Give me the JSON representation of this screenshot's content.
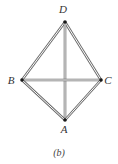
{
  "figure": {
    "caption": "(b)",
    "nodes": [
      {
        "id": "D",
        "label": "D",
        "x": 65,
        "y": 22,
        "lx": 63,
        "ly": 13
      },
      {
        "id": "B",
        "label": "B",
        "x": 22,
        "y": 80,
        "lx": 11,
        "ly": 84
      },
      {
        "id": "C",
        "label": "C",
        "x": 101,
        "y": 80,
        "lx": 108,
        "ly": 84
      },
      {
        "id": "A",
        "label": "A",
        "x": 65,
        "y": 120,
        "lx": 64,
        "ly": 133
      }
    ],
    "edges": [
      [
        "D",
        "B"
      ],
      [
        "D",
        "C"
      ],
      [
        "D",
        "A"
      ],
      [
        "B",
        "C"
      ],
      [
        "B",
        "A"
      ],
      [
        "C",
        "A"
      ]
    ],
    "colors": {
      "edge": "#6a6a6a",
      "node": "#1a1a1a"
    }
  }
}
